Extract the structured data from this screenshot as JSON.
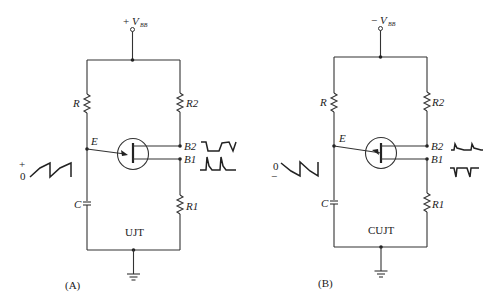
{
  "figures": [
    {
      "id": "A",
      "caption": "(A)",
      "device_label": "UJT",
      "supply": {
        "sign": "+",
        "label": "V",
        "subscript": "BB"
      },
      "components": {
        "R": "R",
        "R2": "R2",
        "R1": "R1",
        "C": "C"
      },
      "nodes": {
        "E": "E",
        "B2": "B2",
        "B1": "B1"
      },
      "emitter_waveform": {
        "type": "sawtooth-rising",
        "polarity_top": "+",
        "polarity_bottom": "0"
      },
      "b2_waveform": "negative-going pulses",
      "b1_waveform": "positive-going spikes"
    },
    {
      "id": "B",
      "caption": "(B)",
      "device_label": "CUJT",
      "supply": {
        "sign": "−",
        "label": "V",
        "subscript": "BB"
      },
      "components": {
        "R": "R",
        "R2": "R2",
        "R1": "R1",
        "C": "C"
      },
      "nodes": {
        "E": "E",
        "B2": "B2",
        "B1": "B1"
      },
      "emitter_waveform": {
        "type": "sawtooth-falling",
        "polarity_top": "0",
        "polarity_bottom": "−"
      },
      "b2_waveform": "positive-going pulses",
      "b1_waveform": "negative-going spikes"
    }
  ]
}
